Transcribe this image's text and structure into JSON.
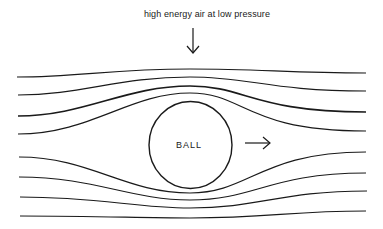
{
  "diagram": {
    "annotation": "high energy air at low pressure",
    "object_label": "BALL",
    "arrows": [
      {
        "name": "down-arrow",
        "direction": "down",
        "meaning": "points to region above ball"
      },
      {
        "name": "right-arrow",
        "direction": "right",
        "meaning": "direction of ball motion"
      }
    ],
    "streamlines_count": 8,
    "colors": {
      "stroke": "#1a1a1a",
      "background": "#ffffff"
    }
  }
}
